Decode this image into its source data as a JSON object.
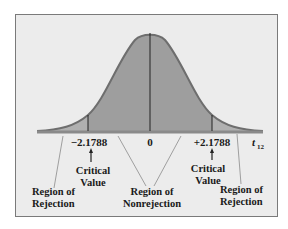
{
  "diagram": {
    "type": "t-distribution-rejection-regions",
    "colors": {
      "background": "#ececec",
      "curve_fill": "#9e9e9e",
      "tail_fill": "#b0b0b0",
      "curve_stroke": "#6e6e6e",
      "frame_border": "#7a7a7a",
      "text": "#1a1a1a"
    },
    "axis": {
      "ticks": [
        {
          "label": "−2.1788",
          "value": -2.1788
        },
        {
          "label": "0",
          "value": 0
        },
        {
          "label": "+2.1788",
          "value": 2.1788
        }
      ],
      "variable_label": "t",
      "variable_subscript": "12"
    },
    "annotations": {
      "critical_left_line1": "Critical",
      "critical_left_line2": "Value",
      "critical_right_line1": "Critical",
      "critical_right_line2": "Value",
      "rejection_left_line1": "Region of",
      "rejection_left_line2": "Rejection",
      "nonrejection_line1": "Region of",
      "nonrejection_line2": "Nonrejection",
      "rejection_right_line1": "Region of",
      "rejection_right_line2": "Rejection"
    }
  }
}
